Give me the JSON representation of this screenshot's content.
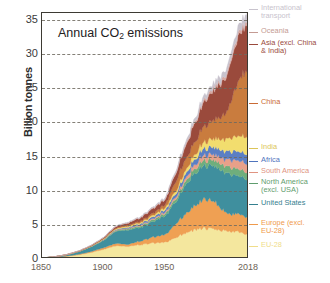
{
  "chart_data": {
    "type": "area",
    "stacked": true,
    "title": "Annual CO2 emissions",
    "title_display": "Annual CO emissions",
    "title_sub": "2",
    "ylabel": "Billion tonnes",
    "xlabel": "",
    "ylim": [
      0,
      36
    ],
    "xlim": [
      1850,
      2018
    ],
    "yticks": [
      0,
      5,
      10,
      15,
      20,
      25,
      30,
      35
    ],
    "xticks": [
      1850,
      1900,
      1950,
      2018
    ],
    "grid": "horizontal-dashed",
    "legend_position": "right-leader-lines",
    "units": "billion tonnes CO2 per year",
    "x": [
      1850,
      1860,
      1870,
      1880,
      1890,
      1900,
      1910,
      1920,
      1930,
      1940,
      1950,
      1960,
      1970,
      1980,
      1990,
      2000,
      2010,
      2018
    ],
    "series": [
      {
        "name": "EU-28",
        "color": "#f4e79e",
        "values": [
          0.12,
          0.22,
          0.38,
          0.62,
          0.95,
          1.4,
          1.95,
          1.85,
          2.1,
          2.3,
          2.4,
          3.3,
          4.1,
          4.5,
          4.3,
          4.1,
          3.9,
          3.4
        ]
      },
      {
        "name": "Europe (excl. EU-28)",
        "color": "#efa053",
        "values": [
          0.01,
          0.02,
          0.04,
          0.08,
          0.14,
          0.25,
          0.35,
          0.3,
          0.55,
          0.85,
          1.1,
          2.1,
          3.1,
          4.1,
          4.2,
          2.5,
          2.6,
          2.55
        ]
      },
      {
        "name": "United States",
        "color": "#3f8f9e",
        "values": [
          0.02,
          0.07,
          0.17,
          0.38,
          0.68,
          1.05,
          1.8,
          2.1,
          2.0,
          2.3,
          2.8,
          3.3,
          4.6,
          4.9,
          5.1,
          5.9,
          5.6,
          5.3
        ]
      },
      {
        "name": "North America (excl. USA)",
        "color": "#6fae7c",
        "values": [
          0.0,
          0.0,
          0.01,
          0.02,
          0.04,
          0.07,
          0.12,
          0.18,
          0.22,
          0.26,
          0.33,
          0.45,
          0.62,
          0.78,
          0.85,
          0.98,
          1.05,
          1.05
        ]
      },
      {
        "name": "South America",
        "color": "#e8a089",
        "values": [
          0.0,
          0.0,
          0.0,
          0.01,
          0.02,
          0.03,
          0.06,
          0.09,
          0.12,
          0.16,
          0.22,
          0.34,
          0.52,
          0.72,
          0.8,
          1.0,
          1.25,
          1.3
        ]
      },
      {
        "name": "Africa",
        "color": "#5b7fc4",
        "values": [
          0.0,
          0.0,
          0.01,
          0.01,
          0.02,
          0.05,
          0.09,
          0.14,
          0.2,
          0.26,
          0.35,
          0.5,
          0.72,
          0.95,
          1.1,
          1.2,
          1.35,
          1.4
        ]
      },
      {
        "name": "India",
        "color": "#f2dd6e",
        "values": [
          0.0,
          0.0,
          0.01,
          0.02,
          0.04,
          0.08,
          0.12,
          0.15,
          0.18,
          0.22,
          0.28,
          0.4,
          0.58,
          0.85,
          1.3,
          1.8,
          2.3,
          2.6
        ]
      },
      {
        "name": "China",
        "color": "#c97c3e",
        "values": [
          0.0,
          0.0,
          0.01,
          0.02,
          0.03,
          0.06,
          0.1,
          0.15,
          0.2,
          0.3,
          0.45,
          1.5,
          1.6,
          2.2,
          2.8,
          3.8,
          8.5,
          10.2
        ]
      },
      {
        "name": "Asia (excl. China & India)",
        "color": "#9a4a3c",
        "values": [
          0.0,
          0.01,
          0.02,
          0.03,
          0.06,
          0.12,
          0.22,
          0.32,
          0.5,
          0.7,
          0.75,
          1.3,
          2.3,
          3.3,
          4.5,
          5.3,
          6.5,
          7.1
        ]
      },
      {
        "name": "Oceania",
        "color": "#d7a9a2",
        "values": [
          0.0,
          0.0,
          0.0,
          0.01,
          0.02,
          0.03,
          0.05,
          0.07,
          0.09,
          0.11,
          0.13,
          0.18,
          0.25,
          0.32,
          0.37,
          0.44,
          0.5,
          0.48
        ]
      },
      {
        "name": "International transport",
        "color": "#c8c3cd",
        "values": [
          0.0,
          0.0,
          0.0,
          0.01,
          0.02,
          0.03,
          0.05,
          0.07,
          0.09,
          0.12,
          0.16,
          0.25,
          0.4,
          0.55,
          0.65,
          0.8,
          1.0,
          1.1
        ]
      }
    ]
  },
  "legend": [
    {
      "label": "International\ntransport",
      "color": "#c8c3cd",
      "top": 4
    },
    {
      "label": "Oceania",
      "color": "#c49b93",
      "top": 27
    },
    {
      "label": "Asia (excl. China\n& India)",
      "color": "#9a4a3c",
      "top": 39
    },
    {
      "label": "China",
      "color": "#c96a35",
      "top": 98
    },
    {
      "label": "India",
      "color": "#dcc558",
      "top": 143
    },
    {
      "label": "Africa",
      "color": "#4f74bd",
      "top": 156
    },
    {
      "label": "South America",
      "color": "#e09481",
      "top": 167
    },
    {
      "label": "North America\n(excl. USA)",
      "color": "#5f9d6e",
      "top": 178
    },
    {
      "label": "United States",
      "color": "#35808f",
      "top": 199
    },
    {
      "label": "Europe (excl.\nEU-28)",
      "color": "#ef9a4c",
      "top": 219
    },
    {
      "label": "EU-28",
      "color": "#f0dd8a",
      "top": 241
    }
  ]
}
